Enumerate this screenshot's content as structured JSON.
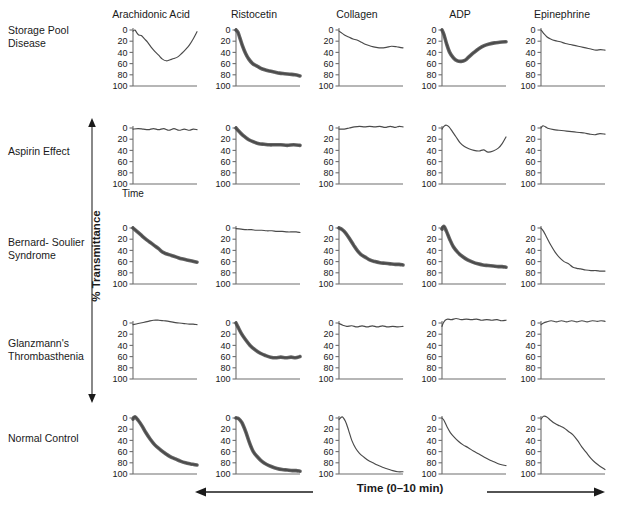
{
  "figure": {
    "caption_fragment": "",
    "axis": {
      "y_label": "% Transmittance",
      "y_ticks": [
        "0",
        "20",
        "40",
        "60",
        "80",
        "100"
      ],
      "y_range": [
        0,
        100
      ],
      "y_inverted": true,
      "x_label": "Time (0–10 min)",
      "x_small_label": "Time",
      "x_range": [
        0,
        10
      ],
      "x_units": "min"
    },
    "curve_color": "#4a4a4a",
    "axis_color": "#6e6e6e"
  },
  "columns": [
    {
      "label": "Arachidonic Acid"
    },
    {
      "label": "Ristocetin"
    },
    {
      "label": "Collagen"
    },
    {
      "label": "ADP"
    },
    {
      "label": "Epinephrine"
    }
  ],
  "rows": [
    {
      "label": "Storage\nPool\nDisease"
    },
    {
      "label": "Aspirin\nEffect"
    },
    {
      "label": "Bernard-\nSoulier\nSyndrome"
    },
    {
      "label": "Glanzmann's\nThrombasthenia"
    },
    {
      "label": "Normal\nControl"
    }
  ],
  "chart_data": {
    "type": "line",
    "xlabel": "Time (0–10 min)",
    "ylabel": "% Transmittance",
    "xlim": [
      0,
      10
    ],
    "ylim": [
      0,
      100
    ],
    "y_inverted": true,
    "grid": false,
    "legend": "none",
    "categories_x": [
      "Arachidonic Acid",
      "Ristocetin",
      "Collagen",
      "ADP",
      "Epinephrine"
    ],
    "categories_y": [
      "Storage Pool Disease",
      "Aspirin Effect",
      "Bernard-Soulier Syndrome",
      "Glanzmann's Thrombasthenia",
      "Normal Control"
    ],
    "panels": [
      {
        "row": "Storage Pool Disease",
        "col": "Arachidonic Acid",
        "thick": false,
        "x": [
          0,
          0.3,
          0.6,
          0.9,
          1.3,
          1.8,
          2.3,
          2.8,
          3.4,
          4.0,
          4.6,
          5.2,
          5.8,
          6.4,
          7.0,
          7.6,
          8.2,
          8.8,
          9.4,
          10
        ],
        "y": [
          2,
          0,
          5,
          9,
          10,
          16,
          22,
          30,
          38,
          45,
          52,
          55,
          53,
          51,
          48,
          42,
          35,
          27,
          16,
          3
        ]
      },
      {
        "row": "Storage Pool Disease",
        "col": "Ristocetin",
        "thick": true,
        "x": [
          0,
          0.3,
          0.6,
          1.0,
          1.5,
          2.0,
          2.6,
          3.2,
          3.8,
          4.5,
          5.2,
          6.0,
          6.8,
          7.6,
          8.4,
          9.2,
          10
        ],
        "y": [
          0,
          4,
          14,
          28,
          42,
          52,
          60,
          64,
          68,
          71,
          73,
          75,
          77,
          78,
          79,
          80,
          82
        ]
      },
      {
        "row": "Storage Pool Disease",
        "col": "Collagen",
        "thick": false,
        "x": [
          0,
          0.5,
          1.0,
          1.6,
          2.2,
          2.8,
          3.5,
          4.2,
          5.0,
          5.8,
          6.6,
          7.4,
          8.2,
          9.0,
          9.5,
          10
        ],
        "y": [
          2,
          6,
          10,
          13,
          16,
          18,
          22,
          26,
          29,
          31,
          32,
          31,
          29,
          30,
          31,
          32
        ]
      },
      {
        "row": "Storage Pool Disease",
        "col": "ADP",
        "thick": true,
        "x": [
          0,
          0.3,
          0.7,
          1.2,
          1.8,
          2.4,
          3.0,
          3.6,
          4.2,
          5.0,
          5.8,
          6.6,
          7.4,
          8.2,
          9.0,
          10
        ],
        "y": [
          0,
          8,
          24,
          40,
          50,
          55,
          56,
          54,
          48,
          40,
          33,
          28,
          25,
          23,
          22,
          21
        ]
      },
      {
        "row": "Storage Pool Disease",
        "col": "Epinephrine",
        "thick": false,
        "x": [
          0,
          0.4,
          0.9,
          1.5,
          2.2,
          3.0,
          3.8,
          4.6,
          5.4,
          6.2,
          7.0,
          7.8,
          8.6,
          9.3,
          10
        ],
        "y": [
          0,
          6,
          12,
          16,
          19,
          21,
          24,
          26,
          28,
          30,
          32,
          34,
          36,
          35,
          36
        ]
      },
      {
        "row": "Aspirin Effect",
        "col": "Arachidonic Acid",
        "thick": false,
        "x": [
          0,
          0.8,
          1.6,
          2.4,
          3.2,
          4.0,
          4.8,
          5.6,
          6.4,
          7.2,
          8.0,
          8.8,
          9.4,
          10
        ],
        "y": [
          2,
          1,
          2,
          3,
          1,
          3,
          1,
          4,
          1,
          4,
          2,
          4,
          2,
          3
        ]
      },
      {
        "row": "Aspirin Effect",
        "col": "Ristocetin",
        "thick": true,
        "x": [
          0,
          0.3,
          0.8,
          1.4,
          2.0,
          2.8,
          3.6,
          4.4,
          5.2,
          6.0,
          7.0,
          8.0,
          9.0,
          10
        ],
        "y": [
          0,
          4,
          10,
          16,
          21,
          25,
          28,
          29,
          30,
          30,
          30,
          31,
          30,
          31
        ]
      },
      {
        "row": "Aspirin Effect",
        "col": "Collagen",
        "thick": false,
        "x": [
          0,
          0.8,
          1.6,
          2.4,
          3.2,
          4.0,
          4.8,
          5.6,
          6.4,
          7.2,
          8.0,
          8.8,
          9.4,
          10
        ],
        "y": [
          2,
          2,
          0,
          -2,
          -3,
          -2,
          -3,
          -2,
          -3,
          -1,
          -3,
          -1,
          -3,
          -2
        ]
      },
      {
        "row": "Aspirin Effect",
        "col": "ADP",
        "thick": false,
        "x": [
          0,
          0.3,
          0.7,
          1.1,
          1.6,
          2.2,
          2.8,
          3.5,
          4.2,
          5.0,
          5.8,
          6.5,
          7.2,
          8.0,
          8.8,
          9.4,
          10
        ],
        "y": [
          2,
          -3,
          -5,
          -2,
          6,
          16,
          26,
          33,
          37,
          40,
          41,
          39,
          43,
          41,
          36,
          28,
          16
        ]
      },
      {
        "row": "Aspirin Effect",
        "col": "Epinephrine",
        "thick": false,
        "x": [
          0,
          0.3,
          0.7,
          1.2,
          2.0,
          2.8,
          3.6,
          4.4,
          5.2,
          6.0,
          6.8,
          7.6,
          8.4,
          9.2,
          10
        ],
        "y": [
          0,
          -4,
          -2,
          1,
          3,
          4,
          5,
          6,
          7,
          8,
          9,
          11,
          12,
          10,
          11
        ]
      },
      {
        "row": "Bernard-Soulier Syndrome",
        "col": "Arachidonic Acid",
        "thick": true,
        "x": [
          0,
          0.6,
          1.2,
          1.9,
          2.6,
          3.3,
          4.0,
          4.6,
          5.2,
          6.0,
          6.8,
          7.6,
          8.4,
          9.2,
          10
        ],
        "y": [
          0,
          6,
          12,
          19,
          25,
          31,
          37,
          43,
          46,
          49,
          52,
          55,
          57,
          59,
          61
        ]
      },
      {
        "row": "Bernard-Soulier Syndrome",
        "col": "Ristocetin",
        "thick": false,
        "x": [
          0,
          0.8,
          1.6,
          2.4,
          3.2,
          4.0,
          4.8,
          5.6,
          6.4,
          7.2,
          8.0,
          8.8,
          9.4,
          10
        ],
        "y": [
          1,
          2,
          3,
          3,
          4,
          4,
          5,
          5,
          6,
          6,
          7,
          7,
          7,
          8
        ]
      },
      {
        "row": "Bernard-Soulier Syndrome",
        "col": "Collagen",
        "thick": true,
        "x": [
          0,
          0.5,
          1.1,
          1.7,
          2.3,
          2.9,
          3.5,
          4.1,
          4.8,
          5.6,
          6.4,
          7.2,
          8.0,
          8.8,
          9.4,
          10
        ],
        "y": [
          0,
          3,
          10,
          20,
          31,
          41,
          48,
          52,
          57,
          60,
          62,
          63,
          64,
          65,
          65,
          66
        ]
      },
      {
        "row": "Bernard-Soulier Syndrome",
        "col": "ADP",
        "thick": true,
        "x": [
          0,
          0.3,
          0.7,
          1.2,
          1.8,
          2.5,
          3.2,
          4.0,
          4.8,
          5.6,
          6.4,
          7.2,
          8.0,
          8.8,
          9.4,
          10
        ],
        "y": [
          2,
          -3,
          6,
          20,
          34,
          44,
          51,
          57,
          61,
          64,
          66,
          67,
          68,
          69,
          69,
          70
        ]
      },
      {
        "row": "Bernard-Soulier Syndrome",
        "col": "Epinephrine",
        "thick": false,
        "x": [
          0,
          0.4,
          0.9,
          1.5,
          2.2,
          2.9,
          3.6,
          4.3,
          5.0,
          5.6,
          6.2,
          7.0,
          7.8,
          8.6,
          9.3,
          10
        ],
        "y": [
          0,
          6,
          17,
          30,
          43,
          53,
          60,
          64,
          70,
          72,
          73,
          75,
          76,
          76,
          77,
          77
        ]
      },
      {
        "row": "Glanzmann's Thrombasthenia",
        "col": "Arachidonic Acid",
        "thick": false,
        "x": [
          0,
          0.8,
          1.6,
          2.4,
          3.2,
          4.0,
          4.8,
          5.6,
          6.4,
          7.2,
          8.0,
          8.8,
          9.4,
          10
        ],
        "y": [
          3,
          1,
          -1,
          -3,
          -5,
          -5,
          -4,
          -3,
          -1,
          0,
          1,
          2,
          2,
          3
        ]
      },
      {
        "row": "Glanzmann's Thrombasthenia",
        "col": "Ristocetin",
        "thick": true,
        "x": [
          0,
          0.3,
          0.8,
          1.5,
          2.2,
          3.0,
          3.8,
          4.6,
          5.4,
          6.2,
          7.0,
          7.8,
          8.6,
          9.3,
          10
        ],
        "y": [
          0,
          7,
          18,
          30,
          40,
          48,
          54,
          58,
          61,
          62,
          61,
          62,
          61,
          62,
          60
        ]
      },
      {
        "row": "Glanzmann's Thrombasthenia",
        "col": "Collagen",
        "thick": false,
        "x": [
          0,
          0.6,
          1.2,
          2.0,
          2.8,
          3.6,
          4.4,
          5.2,
          6.0,
          6.8,
          7.6,
          8.4,
          9.2,
          10
        ],
        "y": [
          1,
          4,
          6,
          5,
          7,
          5,
          7,
          5,
          7,
          5,
          7,
          6,
          7,
          6
        ]
      },
      {
        "row": "Glanzmann's Thrombasthenia",
        "col": "ADP",
        "thick": false,
        "x": [
          0,
          0.2,
          0.5,
          0.9,
          1.5,
          2.2,
          3.0,
          3.8,
          4.6,
          5.4,
          6.2,
          7.0,
          7.8,
          8.6,
          9.3,
          10
        ],
        "y": [
          6,
          0,
          -5,
          -7,
          -6,
          -8,
          -6,
          -7,
          -6,
          -7,
          -5,
          -6,
          -5,
          -6,
          -4,
          -5
        ]
      },
      {
        "row": "Glanzmann's Thrombasthenia",
        "col": "Epinephrine",
        "thick": false,
        "x": [
          0,
          0.4,
          0.9,
          1.6,
          2.4,
          3.2,
          4.0,
          4.8,
          5.6,
          6.4,
          7.2,
          8.0,
          8.8,
          9.4,
          10
        ],
        "y": [
          3,
          0,
          -2,
          -4,
          -2,
          -4,
          -2,
          -4,
          -2,
          -4,
          -2,
          -4,
          -3,
          -4,
          -3
        ]
      },
      {
        "row": "Normal Control",
        "col": "Arachidonic Acid",
        "thick": true,
        "x": [
          0,
          0.3,
          0.8,
          1.4,
          2.0,
          2.7,
          3.4,
          4.2,
          5.0,
          5.8,
          6.6,
          7.4,
          8.2,
          9.0,
          9.5,
          10
        ],
        "y": [
          2,
          -2,
          4,
          14,
          26,
          38,
          48,
          56,
          63,
          69,
          73,
          77,
          80,
          82,
          83,
          84
        ]
      },
      {
        "row": "Normal Control",
        "col": "Ristocetin",
        "thick": true,
        "x": [
          0,
          0.4,
          0.9,
          1.5,
          2.1,
          2.7,
          3.4,
          4.1,
          4.8,
          5.6,
          6.4,
          7.2,
          8.0,
          8.8,
          9.4,
          10
        ],
        "y": [
          0,
          1,
          8,
          24,
          44,
          60,
          70,
          78,
          83,
          87,
          90,
          92,
          93,
          94,
          94,
          95
        ]
      },
      {
        "row": "Normal Control",
        "col": "Collagen",
        "thick": false,
        "x": [
          0,
          0.5,
          1.0,
          1.5,
          2.0,
          2.6,
          3.2,
          3.9,
          4.6,
          5.3,
          6.0,
          6.8,
          7.6,
          8.4,
          9.2,
          10
        ],
        "y": [
          3,
          -2,
          6,
          22,
          40,
          54,
          63,
          70,
          76,
          80,
          84,
          88,
          91,
          94,
          96,
          96
        ]
      },
      {
        "row": "Normal Control",
        "col": "ADP",
        "thick": false,
        "x": [
          0,
          0.3,
          0.8,
          1.3,
          1.9,
          2.6,
          3.3,
          4.1,
          4.9,
          5.7,
          6.5,
          7.3,
          8.1,
          8.9,
          9.5,
          10
        ],
        "y": [
          0,
          4,
          16,
          26,
          34,
          42,
          48,
          53,
          59,
          64,
          69,
          74,
          78,
          82,
          84,
          85
        ]
      },
      {
        "row": "Normal Control",
        "col": "Epinephrine",
        "thick": false,
        "x": [
          0,
          0.4,
          0.9,
          1.5,
          2.2,
          2.9,
          3.6,
          4.3,
          5.0,
          5.7,
          6.4,
          7.1,
          7.8,
          8.5,
          9.2,
          10
        ],
        "y": [
          2,
          -3,
          -2,
          4,
          10,
          14,
          18,
          24,
          30,
          40,
          52,
          62,
          72,
          80,
          86,
          92
        ]
      }
    ]
  }
}
